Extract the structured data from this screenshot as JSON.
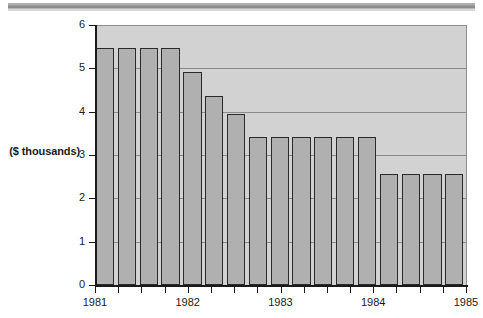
{
  "chart_data": {
    "type": "bar",
    "title": "",
    "subtitle": "",
    "xlabel": "",
    "ylabel": "($ thousands)",
    "ylim": [
      0,
      6
    ],
    "xlim": [
      1981,
      1985
    ],
    "grid": true,
    "legend": null,
    "ytick_labels": [
      "0",
      "1",
      "2",
      "3",
      "4",
      "5",
      "6"
    ],
    "ytick_values": [
      0,
      1,
      2,
      3,
      4,
      5,
      6
    ],
    "xtick_labels": [
      "1981",
      "1982",
      "1983",
      "1984",
      "1985"
    ],
    "xtick_values": [
      1981,
      1982,
      1983,
      1984,
      1985
    ],
    "minor_xticks_per_year": 4,
    "categories": [
      "1981 Q1",
      "1981 Q2",
      "1981 Q3",
      "1981 Q4",
      "1982 Q1",
      "1982 Q2",
      "1982 Q3",
      "1982 Q4",
      "1983 Q1",
      "1983 Q2",
      "1983 Q3",
      "1983 Q4",
      "1984 Q1",
      "1984 Q2",
      "1984 Q3",
      "1984 Q4",
      "1985 Q1"
    ],
    "values": [
      5.48,
      5.48,
      5.48,
      5.48,
      4.92,
      4.37,
      3.94,
      3.42,
      3.42,
      3.42,
      3.42,
      3.42,
      3.42,
      2.56,
      2.56,
      2.56,
      2.56
    ],
    "bar_face_color": "#b0b0b0",
    "bar_edge_color": "#2a2a2a",
    "plot_bg_color": "#d2d2d2",
    "grid_color": "#8a8a8a",
    "axis_color": "#1a1a1a"
  },
  "axis": {
    "y_caption": "($ thousands)"
  },
  "decor": {
    "top_rule": "horizontal-rule"
  }
}
